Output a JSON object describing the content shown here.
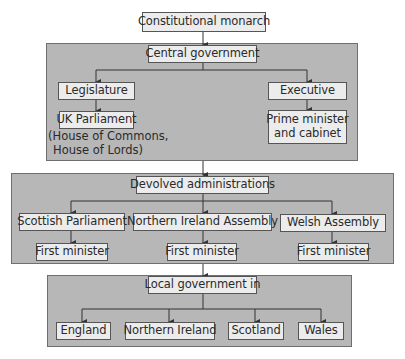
{
  "top": {
    "label": "Constitutional monarch"
  },
  "central": {
    "title": "Central government",
    "legislature": "Legislature",
    "uk_parliament": "UK Parliament",
    "uk_parliament_note_line1": "(House of Commons,",
    "uk_parliament_note_line2": "House of Lords)",
    "executive": "Executive",
    "pm_line1": "Prime minister",
    "pm_line2": "and cabinet"
  },
  "devolved": {
    "title": "Devolved administrations",
    "bodies": [
      {
        "name": "Scottish Parliament",
        "leader": "First minister"
      },
      {
        "name": "Northern Ireland Assembly",
        "leader": "First minister"
      },
      {
        "name": "Welsh Assembly",
        "leader": "First minister"
      }
    ]
  },
  "local": {
    "title": "Local government in",
    "regions": [
      "England",
      "Northern Ireland",
      "Scotland",
      "Wales"
    ]
  },
  "colors": {
    "panel": "#b7b7b7",
    "box": "#ececec",
    "line": "#333333"
  }
}
